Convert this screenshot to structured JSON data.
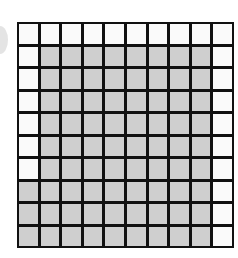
{
  "grid": {
    "rows": 10,
    "cols": 10,
    "shaded_color": "#cfcfcf",
    "unshaded_color": "#fafafa",
    "line_color": "#111111",
    "shaded_count": 75,
    "total_cells": 100,
    "cells": [
      [
        0,
        0,
        0,
        0,
        0,
        0,
        0,
        0,
        0,
        0
      ],
      [
        0,
        1,
        1,
        1,
        1,
        1,
        1,
        1,
        1,
        0
      ],
      [
        0,
        1,
        1,
        1,
        1,
        1,
        1,
        1,
        1,
        0
      ],
      [
        0,
        1,
        1,
        1,
        1,
        1,
        1,
        1,
        1,
        0
      ],
      [
        0,
        1,
        1,
        1,
        1,
        1,
        1,
        1,
        1,
        0
      ],
      [
        0,
        1,
        1,
        1,
        1,
        1,
        1,
        1,
        1,
        0
      ],
      [
        0,
        1,
        1,
        1,
        1,
        1,
        1,
        1,
        1,
        0
      ],
      [
        1,
        1,
        1,
        1,
        1,
        1,
        1,
        1,
        1,
        0
      ],
      [
        1,
        1,
        1,
        1,
        1,
        1,
        1,
        1,
        1,
        0
      ],
      [
        1,
        1,
        1,
        1,
        1,
        1,
        1,
        1,
        1,
        0
      ]
    ]
  }
}
